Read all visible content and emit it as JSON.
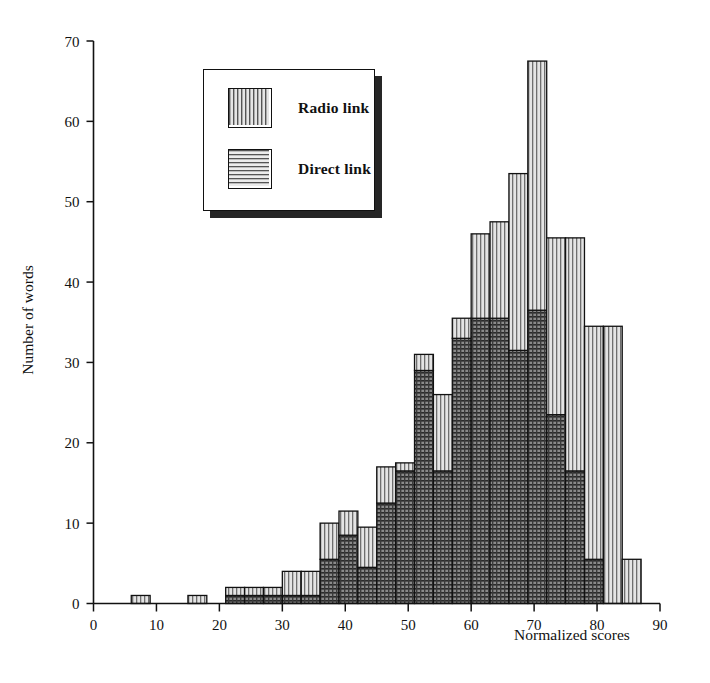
{
  "figure": {
    "y_axis_title": "Number of words",
    "x_axis_title": "Normalized scores"
  },
  "legend": {
    "items": [
      {
        "label": "Radio link",
        "pattern": "vertical-lines",
        "color": "#d8d8d8"
      },
      {
        "label": "Direct link",
        "pattern": "horizontal-lines",
        "color": "#d8d8d8"
      }
    ]
  },
  "chart_data": {
    "type": "bar",
    "subtype": "stacked-histogram",
    "title": "",
    "xlabel": "Normalized scores",
    "ylabel": "Number of words",
    "xlim": [
      0,
      90
    ],
    "ylim": [
      0,
      70
    ],
    "xticks": [
      0,
      10,
      20,
      30,
      40,
      50,
      60,
      70,
      80,
      90
    ],
    "yticks": [
      0,
      10,
      20,
      30,
      40,
      50,
      60,
      70
    ],
    "grid": false,
    "legend_position": "upper-left-inset",
    "bin_width": 3,
    "bin_starts": [
      6,
      9,
      12,
      15,
      18,
      21,
      24,
      27,
      30,
      33,
      36,
      39,
      42,
      45,
      48,
      51,
      54,
      57,
      60,
      63,
      66,
      69,
      72,
      75,
      78,
      81,
      84
    ],
    "categories": [
      "6-9",
      "9-12",
      "12-15",
      "15-18",
      "18-21",
      "21-24",
      "24-27",
      "27-30",
      "30-33",
      "33-36",
      "36-39",
      "39-42",
      "42-45",
      "45-48",
      "48-51",
      "51-54",
      "54-57",
      "57-60",
      "60-63",
      "63-66",
      "66-69",
      "69-72",
      "72-75",
      "75-78",
      "78-81",
      "81-84",
      "84-87"
    ],
    "series": [
      {
        "name": "Direct link",
        "pattern": "horizontal-lines",
        "values": [
          0,
          0,
          0,
          0,
          0,
          1,
          1,
          1,
          1,
          1,
          5.5,
          8.5,
          4.5,
          12.5,
          16.5,
          29,
          16.5,
          33,
          35.5,
          35.5,
          31.5,
          36.5,
          23.5,
          16.5,
          5.5,
          0,
          0
        ]
      },
      {
        "name": "Radio link",
        "pattern": "vertical-lines",
        "values": [
          1,
          0,
          0,
          1,
          0,
          1,
          1,
          1,
          3,
          3,
          4.5,
          3,
          5,
          4.5,
          1,
          2,
          9.5,
          2.5,
          10.5,
          12,
          22,
          31,
          22,
          29,
          29,
          34.5,
          5.5
        ]
      }
    ],
    "totals": [
      1,
      0,
      0,
      1,
      0,
      2,
      2,
      2,
      4,
      4,
      10,
      11.5,
      9.5,
      17,
      17.5,
      31,
      26,
      35.5,
      46,
      47.5,
      53.5,
      67.5,
      45.5,
      45.5,
      34.5,
      34.5,
      5.5
    ]
  }
}
